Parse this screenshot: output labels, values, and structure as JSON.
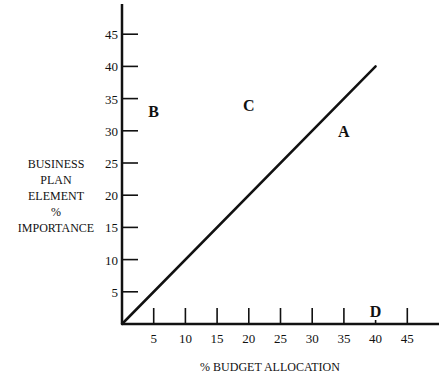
{
  "chart_data": {
    "type": "line",
    "title": "",
    "xlabel": "% BUDGET ALLOCATION",
    "ylabel": [
      "BUSINESS",
      "PLAN",
      "ELEMENT",
      "%",
      "IMPORTANCE"
    ],
    "xlim": [
      0,
      50
    ],
    "ylim": [
      0,
      50
    ],
    "x_ticks": [
      5,
      10,
      15,
      20,
      25,
      30,
      35,
      40,
      45
    ],
    "y_ticks": [
      5,
      10,
      15,
      20,
      25,
      30,
      35,
      40,
      45
    ],
    "grid": false,
    "legend": null,
    "series": [
      {
        "name": "diagonal",
        "x": [
          0,
          40
        ],
        "y": [
          0,
          40
        ],
        "color": "#111111"
      }
    ],
    "annotations": [
      {
        "text": "A",
        "x": 35,
        "y": 30
      },
      {
        "text": "B",
        "x": 5,
        "y": 33
      },
      {
        "text": "C",
        "x": 20,
        "y": 34
      },
      {
        "text": "D",
        "x": 40,
        "y": 2
      }
    ]
  },
  "layout": {
    "origin_px": [
      122,
      324
    ],
    "px_per_unit_x": 6.34,
    "px_per_unit_y": 6.44,
    "x_axis_end_px": 439,
    "y_axis_top_px": 4
  },
  "colors": {
    "ink": "#111111",
    "background": "#ffffff"
  }
}
